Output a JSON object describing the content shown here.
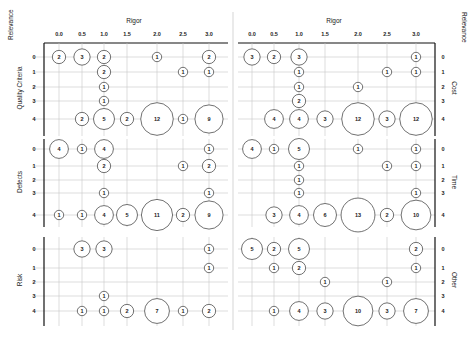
{
  "chart_data": {
    "type": "bubble-matrix",
    "x_axis_title": "Rigor",
    "y_axis_title": "Relevance",
    "x_ticks": [
      "0.0",
      "0.5",
      "1.0",
      "1.5",
      "2.0",
      "2.5",
      "3.0"
    ],
    "y_ticks": [
      "0",
      "1",
      "2",
      "3",
      "4"
    ],
    "grid": true,
    "panels": [
      {
        "name": "Quality Criteria",
        "side": "left",
        "row": 0,
        "points": [
          {
            "x": "0.0",
            "y": "0",
            "n": 2
          },
          {
            "x": "0.5",
            "y": "0",
            "n": 3
          },
          {
            "x": "1.0",
            "y": "0",
            "n": 2
          },
          {
            "x": "2.0",
            "y": "0",
            "n": 1
          },
          {
            "x": "3.0",
            "y": "0",
            "n": 2
          },
          {
            "x": "1.0",
            "y": "1",
            "n": 2
          },
          {
            "x": "2.5",
            "y": "1",
            "n": 1
          },
          {
            "x": "3.0",
            "y": "1",
            "n": 1
          },
          {
            "x": "1.0",
            "y": "2",
            "n": 1
          },
          {
            "x": "1.0",
            "y": "3",
            "n": 1
          },
          {
            "x": "0.5",
            "y": "4",
            "n": 2
          },
          {
            "x": "1.0",
            "y": "4",
            "n": 5
          },
          {
            "x": "1.5",
            "y": "4",
            "n": 2
          },
          {
            "x": "2.0",
            "y": "4",
            "n": 12
          },
          {
            "x": "2.5",
            "y": "4",
            "n": 1
          },
          {
            "x": "3.0",
            "y": "4",
            "n": 9
          }
        ]
      },
      {
        "name": "Cost",
        "side": "right",
        "row": 0,
        "points": [
          {
            "x": "0.0",
            "y": "0",
            "n": 3
          },
          {
            "x": "0.5",
            "y": "0",
            "n": 2
          },
          {
            "x": "1.0",
            "y": "0",
            "n": 3
          },
          {
            "x": "3.0",
            "y": "0",
            "n": 1
          },
          {
            "x": "1.0",
            "y": "1",
            "n": 1
          },
          {
            "x": "2.5",
            "y": "1",
            "n": 1
          },
          {
            "x": "3.0",
            "y": "1",
            "n": 1
          },
          {
            "x": "1.0",
            "y": "2",
            "n": 1
          },
          {
            "x": "2.0",
            "y": "2",
            "n": 1
          },
          {
            "x": "1.0",
            "y": "3",
            "n": 2
          },
          {
            "x": "0.5",
            "y": "4",
            "n": 4
          },
          {
            "x": "1.0",
            "y": "4",
            "n": 4
          },
          {
            "x": "1.5",
            "y": "4",
            "n": 3
          },
          {
            "x": "2.0",
            "y": "4",
            "n": 12
          },
          {
            "x": "2.5",
            "y": "4",
            "n": 3
          },
          {
            "x": "3.0",
            "y": "4",
            "n": 12
          }
        ]
      },
      {
        "name": "Defects",
        "side": "left",
        "row": 1,
        "points": [
          {
            "x": "0.0",
            "y": "0",
            "n": 4
          },
          {
            "x": "0.5",
            "y": "0",
            "n": 1
          },
          {
            "x": "1.0",
            "y": "0",
            "n": 4
          },
          {
            "x": "3.0",
            "y": "0",
            "n": 1
          },
          {
            "x": "1.0",
            "y": "1",
            "n": 2
          },
          {
            "x": "2.5",
            "y": "1",
            "n": 1
          },
          {
            "x": "3.0",
            "y": "1",
            "n": 2
          },
          {
            "x": "1.0",
            "y": "3",
            "n": 1
          },
          {
            "x": "3.0",
            "y": "3",
            "n": 1
          },
          {
            "x": "0.0",
            "y": "4",
            "n": 1
          },
          {
            "x": "0.5",
            "y": "4",
            "n": 1
          },
          {
            "x": "1.0",
            "y": "4",
            "n": 4
          },
          {
            "x": "1.5",
            "y": "4",
            "n": 5
          },
          {
            "x": "2.0",
            "y": "4",
            "n": 11
          },
          {
            "x": "2.5",
            "y": "4",
            "n": 2
          },
          {
            "x": "3.0",
            "y": "4",
            "n": 9
          }
        ]
      },
      {
        "name": "Time",
        "side": "right",
        "row": 1,
        "points": [
          {
            "x": "0.0",
            "y": "0",
            "n": 4
          },
          {
            "x": "0.5",
            "y": "0",
            "n": 1
          },
          {
            "x": "1.0",
            "y": "0",
            "n": 5
          },
          {
            "x": "2.0",
            "y": "0",
            "n": 1
          },
          {
            "x": "3.0",
            "y": "0",
            "n": 1
          },
          {
            "x": "1.0",
            "y": "1",
            "n": 1
          },
          {
            "x": "2.5",
            "y": "1",
            "n": 1
          },
          {
            "x": "3.0",
            "y": "1",
            "n": 1
          },
          {
            "x": "1.0",
            "y": "2",
            "n": 1
          },
          {
            "x": "1.0",
            "y": "3",
            "n": 1
          },
          {
            "x": "3.0",
            "y": "3",
            "n": 1
          },
          {
            "x": "0.5",
            "y": "4",
            "n": 3
          },
          {
            "x": "1.0",
            "y": "4",
            "n": 4
          },
          {
            "x": "1.5",
            "y": "4",
            "n": 6
          },
          {
            "x": "2.0",
            "y": "4",
            "n": 13
          },
          {
            "x": "2.5",
            "y": "4",
            "n": 2
          },
          {
            "x": "3.0",
            "y": "4",
            "n": 10
          }
        ]
      },
      {
        "name": "Risk",
        "side": "left",
        "row": 2,
        "points": [
          {
            "x": "0.5",
            "y": "0",
            "n": 3
          },
          {
            "x": "1.0",
            "y": "0",
            "n": 3
          },
          {
            "x": "3.0",
            "y": "0",
            "n": 1
          },
          {
            "x": "3.0",
            "y": "1",
            "n": 1
          },
          {
            "x": "1.0",
            "y": "3",
            "n": 1
          },
          {
            "x": "0.5",
            "y": "4",
            "n": 1
          },
          {
            "x": "1.0",
            "y": "4",
            "n": 1
          },
          {
            "x": "1.5",
            "y": "4",
            "n": 2
          },
          {
            "x": "2.0",
            "y": "4",
            "n": 7
          },
          {
            "x": "2.5",
            "y": "4",
            "n": 1
          },
          {
            "x": "3.0",
            "y": "4",
            "n": 2
          }
        ]
      },
      {
        "name": "Other",
        "side": "right",
        "row": 2,
        "points": [
          {
            "x": "0.0",
            "y": "0",
            "n": 5
          },
          {
            "x": "0.5",
            "y": "0",
            "n": 2
          },
          {
            "x": "1.0",
            "y": "0",
            "n": 5
          },
          {
            "x": "3.0",
            "y": "0",
            "n": 2
          },
          {
            "x": "0.5",
            "y": "1",
            "n": 1
          },
          {
            "x": "1.0",
            "y": "1",
            "n": 2
          },
          {
            "x": "3.0",
            "y": "1",
            "n": 1
          },
          {
            "x": "1.5",
            "y": "2",
            "n": 1
          },
          {
            "x": "2.5",
            "y": "2",
            "n": 1
          },
          {
            "x": "0.5",
            "y": "4",
            "n": 1
          },
          {
            "x": "1.0",
            "y": "4",
            "n": 4
          },
          {
            "x": "1.5",
            "y": "4",
            "n": 3
          },
          {
            "x": "2.0",
            "y": "4",
            "n": 10
          },
          {
            "x": "2.5",
            "y": "4",
            "n": 3
          },
          {
            "x": "3.0",
            "y": "4",
            "n": 7
          }
        ]
      }
    ]
  },
  "layout": {
    "left_cols": [
      59,
      82,
      104,
      127,
      157,
      183,
      209
    ],
    "right_cols": [
      252,
      274,
      299,
      325,
      358,
      387,
      416
    ],
    "left_axis_x": 44,
    "left_grid_x": [
      32,
      228
    ],
    "right_axis_x": 435,
    "right_grid_x": [
      238,
      435
    ],
    "divider_x": 233,
    "rows": [
      {
        "ys": [
          57,
          72,
          87,
          101,
          119
        ],
        "top": 43,
        "bottom": 136
      },
      {
        "ys": [
          149,
          166,
          180,
          193,
          215
        ],
        "top": 139,
        "bottom": 227
      },
      {
        "ys": [
          249,
          268,
          282,
          296,
          311
        ],
        "top": 237,
        "bottom": 326
      }
    ],
    "top_axis_y": 43,
    "tick_label_y": 36,
    "title_y": 23
  }
}
